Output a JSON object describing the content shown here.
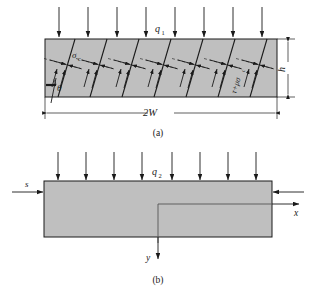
{
  "figure": {
    "caption_a": "(a)",
    "caption_b": "(b)",
    "background_color": "#ffffff",
    "body_fill": "#bfbfbf",
    "line_color": "#1a1a1a"
  },
  "panel_a": {
    "name": "cracked-body-panel",
    "load_label": "q",
    "load_label_sub": "1",
    "stress_label": "σ",
    "stress_label_sub": "c",
    "angle_label": "θ",
    "height_label": "h",
    "width_label": "2W",
    "crack_traction_label": "τ+μσ",
    "crack_traction_label_sub": "c",
    "arrow_count": 8,
    "crack_count": 7
  },
  "panel_b": {
    "name": "notched-body-panel",
    "load_label": "q",
    "load_label_sub": "2",
    "side_load_label": "s",
    "x_axis_label": "x",
    "y_axis_label": "y",
    "arrow_count": 8
  }
}
